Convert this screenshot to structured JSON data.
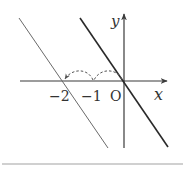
{
  "diagram": {
    "axes": {
      "x_label": "x",
      "y_label": "y",
      "origin_label": "O"
    },
    "tick_labels": [
      "−2",
      "−1"
    ],
    "lines": [
      {
        "name": "original line through origin",
        "passes_through": [
          0,
          0
        ],
        "style": "thick"
      },
      {
        "name": "translated line",
        "passes_through": [
          -2,
          0
        ],
        "style": "thin"
      }
    ],
    "translation_arcs": [
      {
        "from": 0,
        "to": -1,
        "style": "dashed"
      },
      {
        "from": -1,
        "to": -2,
        "style": "dashed",
        "arrow": true
      }
    ],
    "colors": {
      "axis": "#3a3a3a",
      "thick_line": "#2a2a2a",
      "thin_line": "#6a6a6a",
      "dashed": "#555555",
      "border": "#d0d0d0"
    }
  }
}
